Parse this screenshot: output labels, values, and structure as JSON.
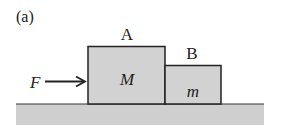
{
  "figure": {
    "panel_label": "(a)",
    "force_label": "F",
    "block_a": {
      "label": "A",
      "mass_label": "M"
    },
    "block_b": {
      "label": "B",
      "mass_label": "m"
    }
  },
  "colors": {
    "block_fill": "#d2d2d2",
    "ground_fill": "#cfcfcf",
    "stroke": "#222222"
  }
}
